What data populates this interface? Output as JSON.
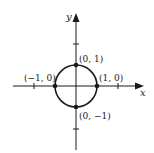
{
  "diagram": {
    "type": "unit-circle",
    "axes": {
      "x_label": "x",
      "y_label": "y",
      "x_ticks": [
        -2,
        2
      ],
      "y_ticks": [
        -2,
        2
      ]
    },
    "circle": {
      "center": [
        0,
        0
      ],
      "radius": 1
    },
    "points": [
      {
        "coords": [
          0,
          1
        ],
        "label": "(0, 1)"
      },
      {
        "coords": [
          1,
          0
        ],
        "label": "(1, 0)"
      },
      {
        "coords": [
          -1,
          0
        ],
        "label": "(−1, 0)"
      },
      {
        "coords": [
          0,
          -1
        ],
        "label": "(0, −1)"
      }
    ],
    "colors": {
      "ink": "#1a1a1a",
      "background": "#ffffff"
    }
  }
}
